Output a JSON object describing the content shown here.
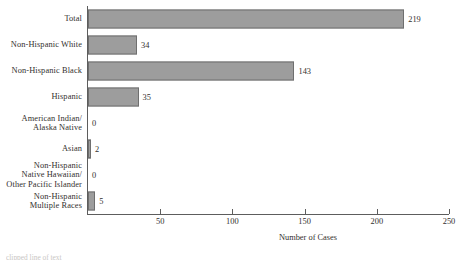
{
  "chart_data": {
    "type": "bar",
    "orientation": "horizontal",
    "title": "",
    "xlabel": "Number of Cases",
    "ylabel": "",
    "xlim": [
      0,
      250
    ],
    "xticks": [
      50,
      100,
      150,
      200,
      250
    ],
    "grid": false,
    "legend": null,
    "bar_color": "#9d9d9d",
    "bar_edge_color": "#6f6f6f",
    "categories": [
      "Total",
      "Non-Hispanic White",
      "Non-Hispanic Black",
      "Hispanic",
      "American Indian/\nAlaska Native",
      "Asian",
      "Non-Hispanic\nNative Hawaiian/\nOther Pacific Islander",
      "Non-Hispanic\nMultiple Races"
    ],
    "values": [
      219,
      34,
      143,
      35,
      0,
      2,
      0,
      5
    ],
    "value_labels": [
      "219",
      "34",
      "143",
      "35",
      "0",
      "2",
      "0",
      "5"
    ]
  },
  "footnote": {
    "clipped_text": "clipped line of text"
  }
}
